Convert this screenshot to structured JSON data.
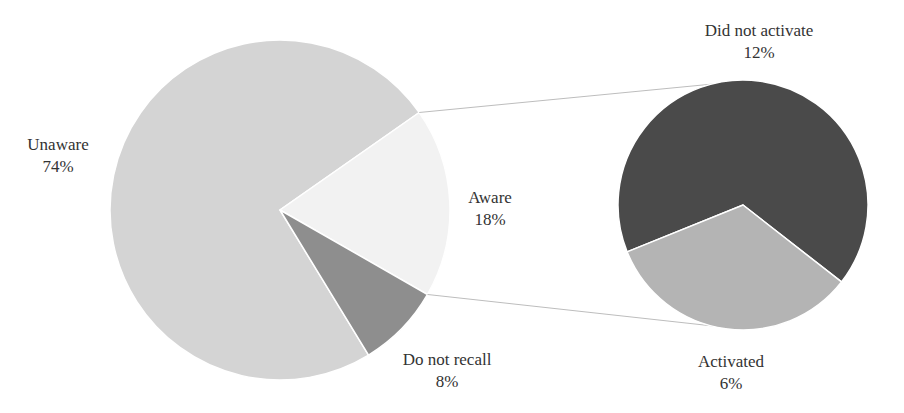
{
  "chart_data": {
    "type": "pie",
    "subtype": "pie-of-pie",
    "title": "",
    "main_pie": {
      "slices": [
        {
          "label": "Unaware",
          "value": 74,
          "display": "74%",
          "color": "#d4d4d4"
        },
        {
          "label": "Aware",
          "value": 18,
          "display": "18%",
          "color": "#f2f2f2"
        },
        {
          "label": "Do not recall",
          "value": 8,
          "display": "8%",
          "color": "#8e8e8e"
        }
      ]
    },
    "secondary_pie": {
      "source_slice": "Aware",
      "slices": [
        {
          "label": "Did not activate",
          "value": 12,
          "display": "12%",
          "color": "#4a4a4a"
        },
        {
          "label": "Activated",
          "value": 6,
          "display": "6%",
          "color": "#b4b4b4"
        }
      ]
    },
    "legend": "none",
    "data_labels": "category name and percentage"
  },
  "labels": {
    "unaware": {
      "name": "Unaware",
      "pct": "74%"
    },
    "aware": {
      "name": "Aware",
      "pct": "18%"
    },
    "do_not_recall": {
      "name": "Do not recall",
      "pct": "8%"
    },
    "did_not_activate": {
      "name": "Did not activate",
      "pct": "12%"
    },
    "activated": {
      "name": "Activated",
      "pct": "6%"
    }
  },
  "colors": {
    "unaware": "#d4d4d4",
    "aware": "#f2f2f2",
    "do_not_recall": "#8e8e8e",
    "did_not_activate": "#4a4a4a",
    "activated": "#b4b4b4",
    "connector": "#bdbdbd",
    "text": "#333333"
  }
}
